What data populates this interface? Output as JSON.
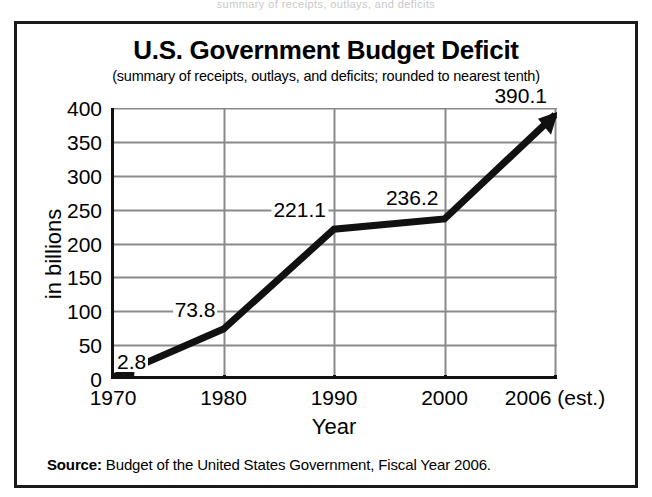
{
  "top_bleed_text": "summary of receipts, outlays, and deficits",
  "figure": {
    "title": "U.S. Government Budget Deficit",
    "subtitle": "(summary of receipts, outlays, and deficits; rounded to nearest tenth)",
    "source_label": "Source:",
    "source_text": " Budget of the United States Government, Fiscal Year 2006."
  },
  "colors": {
    "line": "#111111",
    "gridline": "#8a8a8a",
    "axis": "#111111",
    "frame": "#1a1a1a",
    "background": "#ffffff"
  },
  "chart_data": {
    "type": "line",
    "title": "U.S. Government Budget Deficit",
    "subtitle": "(summary of receipts, outlays, and deficits; rounded to nearest tenth)",
    "xlabel": "Year",
    "ylabel": "in billions",
    "categories": [
      "1970",
      "1980",
      "1990",
      "2000",
      "2006 (est.)"
    ],
    "x_tick_labels": [
      "1970",
      "1980",
      "1990",
      "2000",
      "2006 (est.)"
    ],
    "y_tick_labels": [
      "0",
      "50",
      "100",
      "150",
      "200",
      "250",
      "300",
      "350",
      "400"
    ],
    "y_ticks": [
      0,
      50,
      100,
      150,
      200,
      250,
      300,
      350,
      400
    ],
    "ylim": [
      0,
      400
    ],
    "grid": true,
    "legend": false,
    "series": [
      {
        "name": "Budget deficit",
        "values": [
          2.8,
          73.8,
          221.1,
          236.2,
          390.1
        ],
        "point_labels": [
          "2.8",
          "73.8",
          "221.1",
          "236.2",
          "390.1"
        ]
      }
    ],
    "annotations": [
      "arrowhead at left end of line pointing left",
      "arrowhead at right end of line pointing up-right"
    ],
    "source": "Source: Budget of the United States Government, Fiscal Year 2006."
  }
}
